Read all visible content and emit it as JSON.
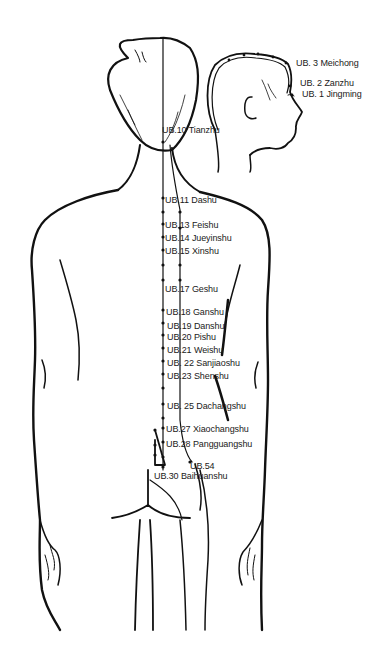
{
  "diagram": {
    "stroke_color": "#111111",
    "background": "#ffffff",
    "head_labels": [
      {
        "id": "ub3",
        "text": "UB. 3 Meichong",
        "x": 296,
        "y": 63
      },
      {
        "id": "ub2",
        "text": "UB. 2 Zanzhu",
        "x": 300,
        "y": 83
      },
      {
        "id": "ub1",
        "text": "UB. 1 Jingming",
        "x": 302,
        "y": 94
      }
    ],
    "back_labels": [
      {
        "id": "ub10",
        "text": "UB.10 Tianzhu",
        "x": 162,
        "y": 129
      },
      {
        "id": "ub11",
        "text": "UB.11 Dashu",
        "x": 165,
        "y": 195
      },
      {
        "id": "ub13",
        "text": "UB.13 Feishu",
        "x": 165,
        "y": 221
      },
      {
        "id": "ub14",
        "text": "UB.14 Jueyinshu",
        "x": 165,
        "y": 234
      },
      {
        "id": "ub15",
        "text": "UB.15 Xinshu",
        "x": 165,
        "y": 247
      },
      {
        "id": "ub17",
        "text": "UB.17 Geshu",
        "x": 165,
        "y": 284
      },
      {
        "id": "ub18",
        "text": "UB.18 Ganshu",
        "x": 166,
        "y": 307
      },
      {
        "id": "ub19",
        "text": "UB.19 Danshu",
        "x": 167,
        "y": 321
      },
      {
        "id": "ub20",
        "text": "UB.20 Pishu",
        "x": 167,
        "y": 332
      },
      {
        "id": "ub21",
        "text": "UB.21 Weishu",
        "x": 167,
        "y": 345
      },
      {
        "id": "ub22",
        "text": "UB. 22 Sanjiaoshu",
        "x": 167,
        "y": 358
      },
      {
        "id": "ub23",
        "text": "UB.23 Shenshu",
        "x": 167,
        "y": 371
      },
      {
        "id": "ub25",
        "text": "UB. 25  Dachangshu",
        "x": 167,
        "y": 401
      },
      {
        "id": "ub27",
        "text": "UB.27 Xiaochangshu",
        "x": 166,
        "y": 424
      },
      {
        "id": "ub28",
        "text": "UB.28 Pangguangshu",
        "x": 166,
        "y": 439
      },
      {
        "id": "ub54",
        "text": "UB.54",
        "x": 190,
        "y": 461
      },
      {
        "id": "ub30",
        "text": "UB.30 Baihuanshu",
        "x": 154,
        "y": 471
      }
    ],
    "spine_points_y": [
      142,
      198,
      212,
      224,
      237,
      250,
      265,
      280,
      310,
      323,
      335,
      348,
      361,
      374,
      388,
      404,
      418,
      428,
      442,
      457,
      467
    ],
    "outer_line_points_y": [
      212,
      228,
      265,
      280,
      415
    ]
  }
}
